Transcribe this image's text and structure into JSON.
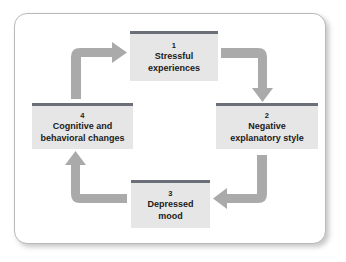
{
  "diagram": {
    "background_color": "#ffffff",
    "frame_border_color": "#b9b9b9",
    "node_fill_color": "#e6e6e6",
    "node_topbar_color": "#6b7078",
    "arrow_color": "#a9a9a9",
    "nodes": [
      {
        "number": "1",
        "label": "Stressful\nexperiences"
      },
      {
        "number": "2",
        "label": "Negative\nexplanatory style"
      },
      {
        "number": "3",
        "label": "Depressed\nmood"
      },
      {
        "number": "4",
        "label": "Cognitive and\nbehavioral changes"
      }
    ],
    "arrows": [
      {
        "name": "arrow-4-to-1",
        "from": "4",
        "to": "1",
        "direction": "up-then-right"
      },
      {
        "name": "arrow-1-to-2",
        "from": "1",
        "to": "2",
        "direction": "right-then-down"
      },
      {
        "name": "arrow-2-to-3",
        "from": "2",
        "to": "3",
        "direction": "down-then-left"
      },
      {
        "name": "arrow-3-to-4",
        "from": "3",
        "to": "4",
        "direction": "left-then-up"
      }
    ]
  }
}
